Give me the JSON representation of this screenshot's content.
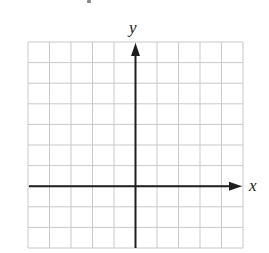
{
  "diagram": {
    "type": "coordinate-grid",
    "grid": {
      "columns": 10,
      "rows": 10,
      "left": 28,
      "top": 42,
      "right": 243,
      "bottom": 248,
      "line_color": "#c9c9c9"
    },
    "axes": {
      "color": "#1e1e1e",
      "x_axis": {
        "label": "x",
        "row_index_from_top": 7,
        "arrow": "right"
      },
      "y_axis": {
        "label": "y",
        "column_index_from_left": 5,
        "arrow": "up"
      }
    }
  },
  "chart_data": {
    "type": "scatter",
    "title": "",
    "xlabel": "x",
    "ylabel": "y",
    "grid": true,
    "x_range_cells": [
      -5,
      5
    ],
    "y_range_cells": [
      -3,
      7
    ],
    "series": []
  }
}
